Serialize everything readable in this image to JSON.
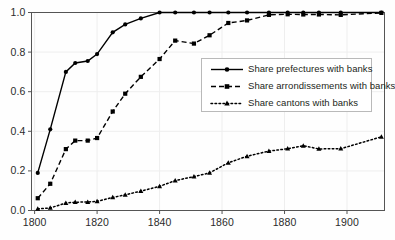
{
  "figure": {
    "width": 395,
    "height": 240,
    "background": "#fefefe",
    "axis_color": "#555555",
    "grid_color": "#eeeeee",
    "series_color": "#000000"
  },
  "chart_data": {
    "type": "line",
    "title": "",
    "subtitle": "",
    "xlabel": "",
    "ylabel": "",
    "xlim": [
      1799,
      1912
    ],
    "ylim": [
      0.0,
      1.0
    ],
    "grid": true,
    "grid_axes": "both",
    "legend_position": "center-right",
    "xticks": [
      1800,
      1820,
      1840,
      1860,
      1880,
      1900
    ],
    "xtick_labels": [
      "1800",
      "1820",
      "1840",
      "1860",
      "1880",
      "1900"
    ],
    "yticks": [
      0.0,
      0.2,
      0.4,
      0.6,
      0.8,
      1.0
    ],
    "ytick_labels": [
      "0.0",
      "0.2",
      "0.4",
      "0.6",
      "0.8",
      "1.0"
    ],
    "series": [
      {
        "name": "Share prefectures with banks",
        "marker": "circle",
        "linestyle": "solid",
        "x": [
          1801,
          1805,
          1810,
          1813,
          1817,
          1820,
          1825,
          1829,
          1834,
          1840,
          1845,
          1851,
          1856,
          1862,
          1868,
          1875,
          1881,
          1886,
          1891,
          1898,
          1911
        ],
        "values": [
          0.19,
          0.41,
          0.7,
          0.745,
          0.755,
          0.79,
          0.9,
          0.94,
          0.97,
          1.0,
          1.0,
          1.0,
          1.0,
          1.0,
          1.0,
          1.0,
          1.0,
          1.0,
          1.0,
          1.0,
          1.0
        ]
      },
      {
        "name": "Share arrondissements with banks",
        "marker": "square",
        "linestyle": "dashed",
        "x": [
          1801,
          1805,
          1810,
          1813,
          1817,
          1820,
          1825,
          1829,
          1834,
          1840,
          1845,
          1851,
          1856,
          1862,
          1868,
          1875,
          1881,
          1886,
          1891,
          1898,
          1911
        ],
        "values": [
          0.062,
          0.135,
          0.31,
          0.353,
          0.353,
          0.366,
          0.5,
          0.59,
          0.675,
          0.765,
          0.858,
          0.843,
          0.885,
          0.947,
          0.96,
          0.988,
          0.991,
          0.99,
          0.99,
          0.988,
          0.998
        ]
      },
      {
        "name": "Share cantons with banks",
        "marker": "triangle",
        "linestyle": "dotted",
        "x": [
          1801,
          1805,
          1810,
          1813,
          1817,
          1820,
          1825,
          1829,
          1834,
          1840,
          1845,
          1851,
          1856,
          1862,
          1868,
          1875,
          1881,
          1886,
          1891,
          1898,
          1911
        ],
        "values": [
          0.008,
          0.013,
          0.038,
          0.042,
          0.043,
          0.046,
          0.066,
          0.079,
          0.098,
          0.122,
          0.151,
          0.171,
          0.19,
          0.241,
          0.274,
          0.3,
          0.312,
          0.327,
          0.311,
          0.312,
          0.372
        ]
      }
    ]
  },
  "legend": {
    "entries": [
      {
        "label": "Share prefectures with banks",
        "key": "solid-circle-key"
      },
      {
        "label": "Share arrondissements with banks",
        "key": "dashed-square-key"
      },
      {
        "label": "Share cantons with banks",
        "key": "dotted-triangle-key"
      }
    ]
  }
}
